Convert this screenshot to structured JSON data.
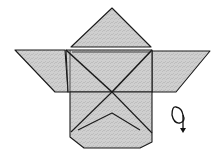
{
  "diagram": {
    "paper_fill": "#c8c8c8",
    "outline_color": "#1a1a1a",
    "symbol": "turn-over"
  }
}
